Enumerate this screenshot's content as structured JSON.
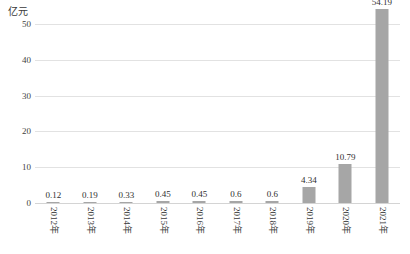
{
  "chart_data": {
    "type": "bar",
    "title": "",
    "subtitle": "",
    "xlabel": "",
    "ylabel": "亿元",
    "unit_label": "亿元",
    "categories": [
      "2012年",
      "2013年",
      "2014年",
      "2015年",
      "2016年",
      "2017年",
      "2018年",
      "2019年",
      "2020年",
      "2021年"
    ],
    "values": [
      0.12,
      0.19,
      0.33,
      0.45,
      0.45,
      0.6,
      0.6,
      4.34,
      10.79,
      54.19
    ],
    "value_labels": [
      "0.12",
      "0.19",
      "0.33",
      "0.45",
      "0.45",
      "0.6",
      "0.6",
      "4.34",
      "10.79",
      "54.19"
    ],
    "ylim": [
      0,
      50
    ],
    "y_ticks": [
      0,
      10,
      20,
      30,
      40,
      50
    ],
    "y_tick_labels": [
      "0",
      "10",
      "20",
      "30",
      "40",
      "50"
    ],
    "grid": true,
    "legend": "none",
    "bar_color": "#a6a6a6",
    "gridline_color": "#e2e2e2",
    "background_color": "#ffffff",
    "text_color": "#333333",
    "x_label_rotation": 90
  }
}
